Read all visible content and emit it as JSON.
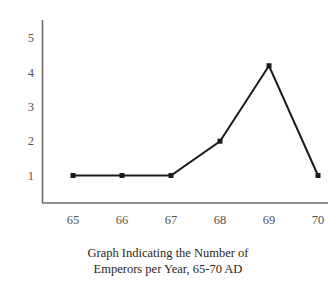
{
  "caption": {
    "line1": "Graph Indicating the Number of",
    "line2": "Emperors per Year, 65-70 AD"
  },
  "axis": {
    "y_ticks": [
      "5",
      "4",
      "3",
      "2",
      "1"
    ],
    "x_ticks": [
      "65",
      "66",
      "67",
      "68",
      "69",
      "70"
    ]
  },
  "colors": {
    "background": "#ffffff",
    "line": "#1a1a1a",
    "marker": "#1a1a1a",
    "axis": "#6e6b68",
    "tick_text": "#55524f",
    "caption_text": "#2a2724"
  },
  "chart_data": {
    "type": "line",
    "title": "Graph Indicating the Number of Emperors per Year, 65-70 AD",
    "xlabel": "",
    "ylabel": "",
    "categories": [
      "65",
      "66",
      "67",
      "68",
      "69",
      "70"
    ],
    "x": [
      65,
      66,
      67,
      68,
      69,
      70
    ],
    "values": [
      1,
      1,
      1,
      2,
      4.2,
      1
    ],
    "series": [
      {
        "name": "Emperors per Year",
        "values": [
          1,
          1,
          1,
          2,
          4.2,
          1
        ]
      }
    ],
    "xlim": [
      64.4,
      70.6
    ],
    "ylim": [
      0,
      5.4
    ],
    "ytick_values": [
      5,
      4,
      3,
      2,
      1
    ],
    "xtick_values": [
      65,
      66,
      67,
      68,
      69,
      70
    ],
    "grid": false,
    "legend": false,
    "markers": "square",
    "marker_size": 5,
    "line_width": 2
  }
}
